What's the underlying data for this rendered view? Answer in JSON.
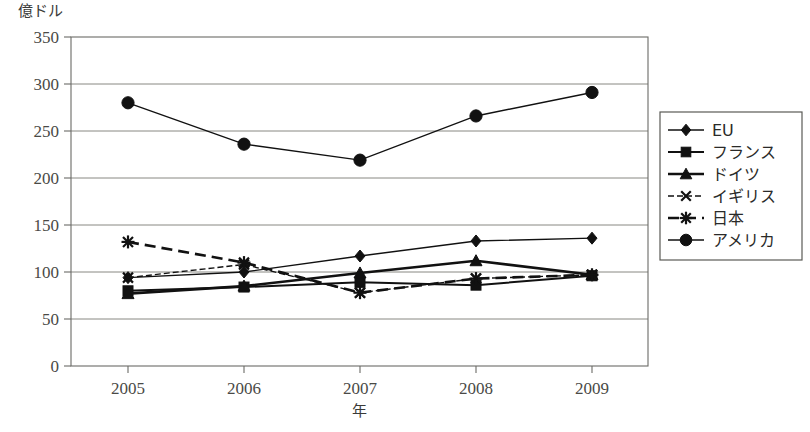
{
  "chart_data": {
    "type": "line",
    "title": "",
    "xlabel": "年",
    "ylabel": "億ドル",
    "categories": [
      "2005",
      "2006",
      "2007",
      "2008",
      "2009"
    ],
    "x": [
      2005,
      2006,
      2007,
      2008,
      2009
    ],
    "ylim": [
      0,
      350
    ],
    "yticks": [
      0,
      50,
      100,
      150,
      200,
      250,
      300,
      350
    ],
    "ytick_labels": [
      "0",
      "50",
      "100",
      "150",
      "200",
      "250",
      "300",
      "350"
    ],
    "grid": "horizontal",
    "legend_position": "right-outside",
    "series": [
      {
        "name": "EU",
        "marker": "diamond",
        "dash": "solid",
        "values": [
          94,
          100,
          117,
          133,
          136
        ]
      },
      {
        "name": "フランス",
        "marker": "square",
        "dash": "solid",
        "values": [
          80,
          84,
          89,
          86,
          96
        ]
      },
      {
        "name": "ドイツ",
        "marker": "triangle",
        "dash": "solid",
        "values": [
          77,
          85,
          99,
          112,
          97
        ]
      },
      {
        "name": "イギリス",
        "marker": "cross",
        "dash": "fine-dash",
        "values": [
          94,
          108,
          78,
          93,
          97
        ]
      },
      {
        "name": "日本",
        "marker": "asterisk",
        "dash": "heavy-dash",
        "values": [
          132,
          110,
          78,
          93,
          97
        ]
      },
      {
        "name": "アメリカ",
        "marker": "circle",
        "dash": "solid",
        "values": [
          280,
          236,
          219,
          266,
          291
        ]
      }
    ]
  },
  "legend": {
    "items": [
      {
        "label": "EU"
      },
      {
        "label": "フランス"
      },
      {
        "label": "ドイツ"
      },
      {
        "label": "イギリス"
      },
      {
        "label": "日本"
      },
      {
        "label": "アメリカ"
      }
    ]
  },
  "colors": {
    "ink": "#111111",
    "frame": "#6b6b66",
    "text": "#4a4a46",
    "background": "#ffffff"
  }
}
